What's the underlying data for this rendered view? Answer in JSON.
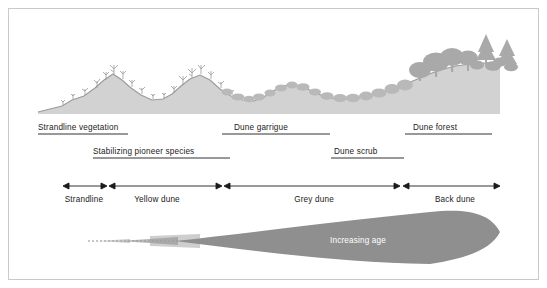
{
  "figure": {
    "background": "#ffffff",
    "frame_color": "#c9c9c9"
  },
  "profile": {
    "ground_color": "#d2d2d2",
    "line_color": "#9a9a9a",
    "vegetation_color": "#b4b4b4",
    "tree_color": "#a8a8a8"
  },
  "zone_labels_row1": [
    {
      "text": "Strandline vegetation",
      "x": 38,
      "y": 128,
      "align": "left",
      "bar_x1": 38,
      "bar_x2": 128
    },
    {
      "text": "Dune garrigue",
      "x": 231,
      "y": 128,
      "align": "left",
      "bar_x1": 222,
      "bar_x2": 330
    },
    {
      "text": "Dune forest",
      "x": 413,
      "y": 128,
      "align": "left",
      "bar_x1": 405,
      "bar_x2": 492
    }
  ],
  "zone_labels_row2": [
    {
      "text": "Stabilizing pioneer species",
      "x": 93,
      "y": 152,
      "bar_x1": 93,
      "bar_x2": 230
    },
    {
      "text": "Dune scrub",
      "x": 331,
      "y": 152,
      "bar_x1": 331,
      "bar_x2": 404
    }
  ],
  "dune_types": [
    {
      "label": "Strandline",
      "center": 84,
      "arrow_x1": 63,
      "arrow_x2": 107
    },
    {
      "label": "Yellow dune",
      "center": 157,
      "arrow_x1": 109,
      "arrow_x2": 222
    },
    {
      "label": "Grey dune",
      "center": 314,
      "arrow_x1": 224,
      "arrow_x2": 400
    },
    {
      "label": "Back dune",
      "center": 455,
      "arrow_x1": 403,
      "arrow_x2": 500
    }
  ],
  "arrow_row": {
    "y": 186,
    "label_y": 198,
    "color": "#1b1b1b"
  },
  "age_wedge": {
    "label": "Increasing age",
    "label_x": 358,
    "label_y": 239,
    "fill_color": "#8f8f8f",
    "tip_x": 88,
    "tip_y": 241,
    "end_x": 500
  }
}
